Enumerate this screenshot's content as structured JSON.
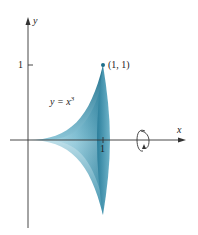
{
  "figure": {
    "type": "solid-of-revolution",
    "curve_label": "y = x",
    "curve_exponent": "3",
    "point_label": "(1, 1)",
    "x_axis_label": "x",
    "y_axis_label": "y",
    "x_tick_label": "1",
    "y_tick_label": "1",
    "rotation_axis": "x",
    "colors": {
      "solid_dark": "#1f6f8b",
      "solid_mid": "#3c93ad",
      "solid_light": "#a9d3e0",
      "axis": "#333333"
    }
  }
}
